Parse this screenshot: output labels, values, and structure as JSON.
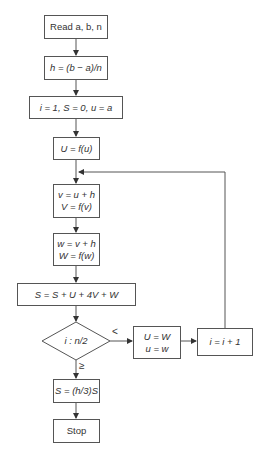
{
  "flowchart": {
    "title": "Simpson's rule flowchart",
    "nodes": {
      "read": {
        "text": "Read a, b, n"
      },
      "h": {
        "text": "h = (b − a)/n"
      },
      "init": {
        "text": "i = 1, S = 0, u = a"
      },
      "U": {
        "text": "U = f(u)"
      },
      "v": {
        "line1": "v = u + h",
        "line2": "V = f(v)"
      },
      "w": {
        "line1": "w = v + h",
        "line2": "W = f(w)"
      },
      "sum": {
        "text": "S = S + U + 4V + W"
      },
      "decision": {
        "text": "i : n/2"
      },
      "shift": {
        "line1": "U = W",
        "line2": "u = w"
      },
      "inc": {
        "text": "i = i + 1"
      },
      "final": {
        "text": "S = (h/3)S"
      },
      "stop": {
        "text": "Stop"
      }
    },
    "edges": {
      "less_label": "<",
      "geq_label": "≥"
    }
  }
}
